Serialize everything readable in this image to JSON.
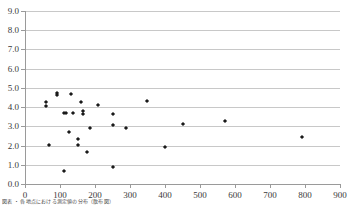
{
  "chart_data": {
    "type": "scatter",
    "title": "",
    "xlabel": "",
    "ylabel": "",
    "xlim": [
      0,
      900
    ],
    "ylim": [
      0,
      9
    ],
    "xticks": [
      0,
      100,
      200,
      300,
      400,
      500,
      600,
      700,
      800,
      900
    ],
    "yticks": [
      "0.0",
      "1.0",
      "2.0",
      "3.0",
      "4.0",
      "5.0",
      "6.0",
      "7.0",
      "8.0",
      "9.0"
    ],
    "grid": "horizontal",
    "legend": "none",
    "marker": "diamond",
    "marker_color": "#1a1a1a",
    "series": [
      {
        "name": "series-1",
        "points": [
          [
            60,
            4.25
          ],
          [
            60,
            4.05
          ],
          [
            68,
            2.01
          ],
          [
            90,
            4.75
          ],
          [
            90,
            4.65
          ],
          [
            110,
            3.7
          ],
          [
            112,
            0.68
          ],
          [
            118,
            3.71
          ],
          [
            125,
            2.72
          ],
          [
            130,
            4.68
          ],
          [
            136,
            3.7
          ],
          [
            150,
            2.35
          ],
          [
            152,
            2.05
          ],
          [
            160,
            4.28
          ],
          [
            165,
            3.8
          ],
          [
            165,
            3.62
          ],
          [
            178,
            1.65
          ],
          [
            185,
            2.92
          ],
          [
            208,
            4.12
          ],
          [
            250,
            3.62
          ],
          [
            250,
            3.06
          ],
          [
            250,
            0.89
          ],
          [
            288,
            2.92
          ],
          [
            348,
            4.31
          ],
          [
            400,
            1.93
          ],
          [
            450,
            3.1
          ],
          [
            570,
            3.3
          ],
          [
            790,
            2.45
          ]
        ]
      }
    ]
  },
  "caption": {
    "text": "図表 ・ 各地点における測定値の分布（散布図）"
  }
}
